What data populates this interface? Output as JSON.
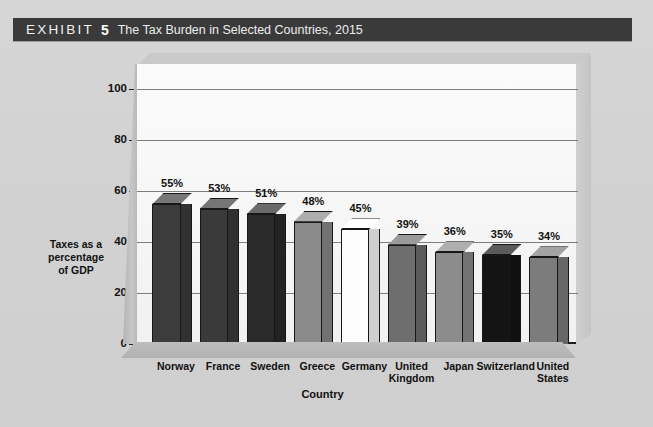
{
  "header": {
    "exhibit_word": "EXHIBIT",
    "exhibit_number": "5",
    "title": "The Tax Burden in Selected Countries, 2015",
    "bar_color": "#3a3a3a",
    "text_color": "#f2f2f2"
  },
  "page": {
    "background_color": "#d4d4d4"
  },
  "chart_data": {
    "type": "bar",
    "title": "The Tax Burden in Selected Countries, 2015",
    "xlabel": "Country",
    "ylabel": "Taxes as a percentage of GDP",
    "ylabel_lines": [
      "Taxes as a",
      "percentage",
      "of GDP"
    ],
    "categories": [
      "Norway",
      "France",
      "Sweden",
      "Greece",
      "Germany",
      "United Kingdom",
      "Japan",
      "Switzerland",
      "United States"
    ],
    "category_lines": [
      [
        "Norway"
      ],
      [
        "France"
      ],
      [
        "Sweden"
      ],
      [
        "Greece"
      ],
      [
        "Germany"
      ],
      [
        "United",
        "Kingdom"
      ],
      [
        "Japan"
      ],
      [
        "Switzerland"
      ],
      [
        "United",
        "States"
      ]
    ],
    "values": [
      55,
      53,
      51,
      48,
      45,
      39,
      36,
      35,
      34
    ],
    "data_labels": [
      "55%",
      "53%",
      "51%",
      "48%",
      "45%",
      "39%",
      "36%",
      "35%",
      "34%"
    ],
    "bar_colors": [
      "#3c3c3c",
      "#3a3a3a",
      "#2a2a2a",
      "#8a8a8a",
      "#fdfdfd",
      "#6e6e6e",
      "#8c8c8c",
      "#141414",
      "#7c7c7c"
    ],
    "ylim": [
      0,
      110
    ],
    "yticks": [
      0,
      20,
      40,
      60,
      80,
      100
    ],
    "ytick_labels": [
      "0",
      "20",
      "40",
      "60",
      "80",
      "100"
    ],
    "grid": true,
    "grid_color": "#7e7e7e",
    "legend": null,
    "legend_position": "none",
    "projection": "3d",
    "plot_background": "#fbfbfb",
    "axis_color": "#1d1d1d"
  }
}
